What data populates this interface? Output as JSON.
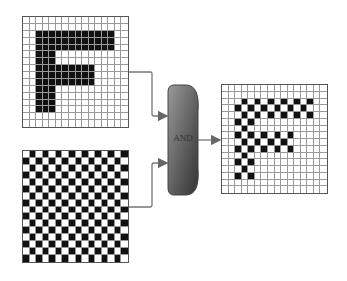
{
  "diagram": {
    "type": "logic-operation",
    "grid_size": 16,
    "inputs": [
      {
        "name": "F pattern",
        "pattern": "letter-F",
        "fill": "#111111"
      },
      {
        "name": "checkerboard",
        "pattern": "checkerboard",
        "fill": "#111111"
      }
    ],
    "gate": {
      "label": "AND",
      "color_light": "#8a8a8a",
      "color_dark": "#3a3a3a"
    },
    "output": {
      "name": "F AND checkerboard"
    },
    "f_shape": {
      "vertical": {
        "cols": [
          2,
          4
        ],
        "rows": [
          2,
          13
        ]
      },
      "top_bar": {
        "cols": [
          2,
          13
        ],
        "rows": [
          2,
          4
        ]
      },
      "middle_bar": {
        "cols": [
          2,
          10
        ],
        "rows": [
          7,
          9
        ]
      }
    },
    "checker_black_when": "(row+col) odd"
  }
}
